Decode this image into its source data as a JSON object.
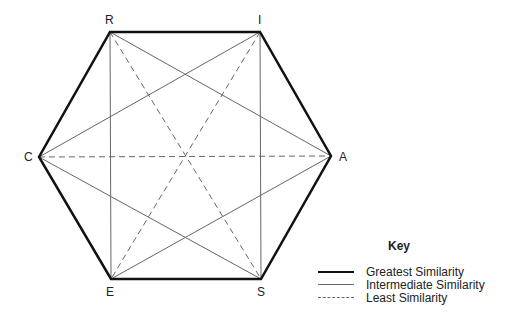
{
  "diagram": {
    "vertices": [
      {
        "id": "R",
        "label": "R",
        "x": 110,
        "y": 32
      },
      {
        "id": "I",
        "label": "I",
        "x": 260,
        "y": 32
      },
      {
        "id": "A",
        "label": "A",
        "x": 331,
        "y": 156
      },
      {
        "id": "S",
        "label": "S",
        "x": 261,
        "y": 279
      },
      {
        "id": "E",
        "label": "E",
        "x": 111,
        "y": 279
      },
      {
        "id": "C",
        "label": "C",
        "x": 39,
        "y": 157
      }
    ],
    "edges_greatest": [
      [
        "R",
        "I"
      ],
      [
        "I",
        "A"
      ],
      [
        "A",
        "S"
      ],
      [
        "S",
        "E"
      ],
      [
        "E",
        "C"
      ],
      [
        "C",
        "R"
      ]
    ],
    "edges_intermediate": [
      [
        "R",
        "E"
      ],
      [
        "I",
        "S"
      ],
      [
        "R",
        "A"
      ],
      [
        "I",
        "C"
      ],
      [
        "C",
        "S"
      ],
      [
        "E",
        "A"
      ]
    ],
    "edges_least": [
      [
        "R",
        "S"
      ],
      [
        "I",
        "E"
      ],
      [
        "C",
        "A"
      ]
    ]
  },
  "key": {
    "title": "Key",
    "items": [
      {
        "style": "greatest",
        "label": "Greatest Similarity"
      },
      {
        "style": "intermediate",
        "label": "Intermediate Similarity"
      },
      {
        "style": "least",
        "label": "Least Similarity"
      }
    ]
  },
  "colors": {
    "greatest": "#111111",
    "intermediate": "#666666",
    "least": "#666666"
  }
}
